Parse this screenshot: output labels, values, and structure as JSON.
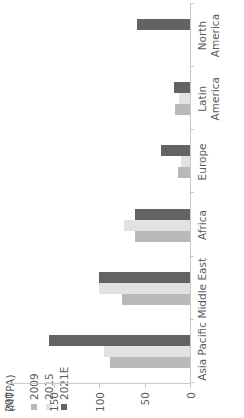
{
  "chart_data": {
    "type": "bar",
    "orientation": "vertical-columns-rotated-90ccw",
    "title": "",
    "xlabel": "",
    "ylabel": "(MTPA)",
    "ylim": [
      0,
      200
    ],
    "yticks": [
      0,
      50,
      100,
      150,
      200
    ],
    "grid": false,
    "legend_position": "top-left",
    "categories": [
      "Asia Pacific",
      "Middle East",
      "Africa",
      "Europe",
      "Latin America",
      "North America"
    ],
    "category_lines": [
      [
        "Asia Pacific"
      ],
      [
        "Middle East"
      ],
      [
        "Africa"
      ],
      [
        "Europe"
      ],
      [
        "Latin",
        "America"
      ],
      [
        "North",
        "America"
      ]
    ],
    "series": [
      {
        "name": "2009",
        "color": "#b9b9b9",
        "values": [
          88,
          75,
          60,
          13,
          17,
          null
        ]
      },
      {
        "name": "2015",
        "color": "#e2e2e2",
        "values": [
          95,
          100,
          72,
          10,
          12,
          null
        ]
      },
      {
        "name": "2021E",
        "color": "#636363",
        "values": [
          155,
          100,
          60,
          32,
          18,
          58
        ]
      }
    ]
  },
  "axis": {
    "title": "(MTPA)",
    "tick_labels": [
      "200",
      "150",
      "100",
      "50",
      "0"
    ]
  },
  "legend": {
    "items": [
      {
        "label": "2009",
        "color": "#b9b9b9"
      },
      {
        "label": "2015",
        "color": "#e2e2e2"
      },
      {
        "label": "2021E",
        "color": "#636363"
      }
    ]
  },
  "colors": {
    "axis_line": "#c9c9c9",
    "text": "#5b5b5b",
    "background": "#ffffff"
  }
}
